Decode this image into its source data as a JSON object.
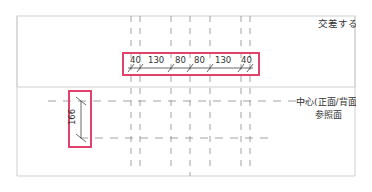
{
  "view": {
    "labels": {
      "intersect": "交差する壁",
      "center_ref_line1": "中心(正面/背面)",
      "center_ref_line2": "参照面"
    },
    "horizontal_dimensions": [
      "40",
      "130",
      "80",
      "80",
      "130",
      "40"
    ],
    "vertical_dimension": "166",
    "colors": {
      "frame": "#c8c8c8",
      "highlight": "#e0446a",
      "line": "#555555",
      "ref_line": "#9a9a9a"
    }
  }
}
